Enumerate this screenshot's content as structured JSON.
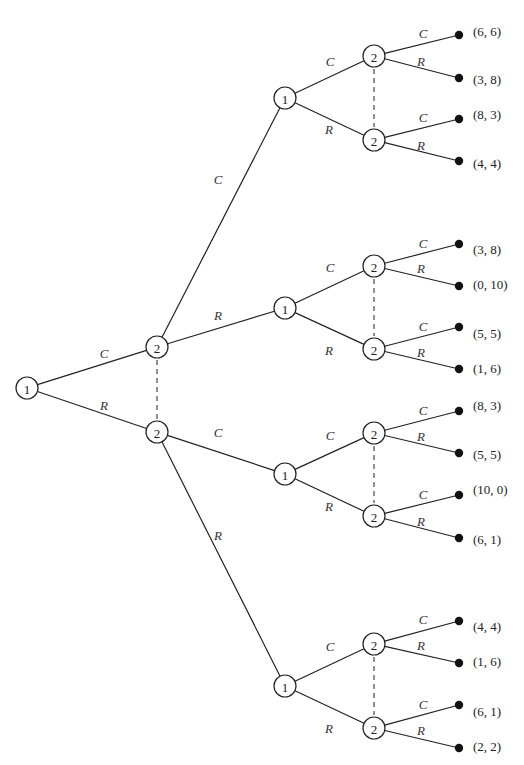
{
  "diagram": {
    "type": "extensive-form game tree",
    "players": [
      "1",
      "2"
    ],
    "actions": [
      "C",
      "R"
    ],
    "root": {
      "id": "n0",
      "player": "1",
      "x": 27,
      "y": 388
    },
    "nodes": [
      {
        "id": "n0",
        "player": "1",
        "x": 27,
        "y": 388
      },
      {
        "id": "a",
        "player": "2",
        "x": 157,
        "y": 347
      },
      {
        "id": "b",
        "player": "2",
        "x": 157,
        "y": 432
      },
      {
        "id": "aC",
        "player": "1",
        "x": 285,
        "y": 98
      },
      {
        "id": "aR",
        "player": "1",
        "x": 285,
        "y": 308
      },
      {
        "id": "bC",
        "player": "1",
        "x": 285,
        "y": 474
      },
      {
        "id": "bR",
        "player": "1",
        "x": 285,
        "y": 686
      },
      {
        "id": "aCC",
        "player": "2",
        "x": 374,
        "y": 56
      },
      {
        "id": "aCR",
        "player": "2",
        "x": 374,
        "y": 140
      },
      {
        "id": "aRC",
        "player": "2",
        "x": 374,
        "y": 266
      },
      {
        "id": "aRR",
        "player": "2",
        "x": 374,
        "y": 349
      },
      {
        "id": "bCC",
        "player": "2",
        "x": 374,
        "y": 433
      },
      {
        "id": "bCR",
        "player": "2",
        "x": 374,
        "y": 516
      },
      {
        "id": "bRC",
        "player": "2",
        "x": 374,
        "y": 644
      },
      {
        "id": "bRR",
        "player": "2",
        "x": 374,
        "y": 728
      }
    ],
    "edges": [
      {
        "from": "n0",
        "to": "a",
        "label": "C",
        "lx": 104,
        "ly": 358
      },
      {
        "from": "n0",
        "to": "b",
        "label": "R",
        "lx": 104,
        "ly": 410
      },
      {
        "from": "a",
        "to": "aC",
        "label": "C",
        "lx": 218,
        "ly": 184
      },
      {
        "from": "a",
        "to": "aR",
        "label": "R",
        "lx": 218,
        "ly": 320
      },
      {
        "from": "b",
        "to": "bC",
        "label": "C",
        "lx": 218,
        "ly": 437
      },
      {
        "from": "b",
        "to": "bR",
        "label": "R",
        "lx": 218,
        "ly": 540
      },
      {
        "from": "aC",
        "to": "aCC",
        "label": "C",
        "lx": 330,
        "ly": 66
      },
      {
        "from": "aC",
        "to": "aCR",
        "label": "R",
        "lx": 329,
        "ly": 134
      },
      {
        "from": "aR",
        "to": "aRC",
        "label": "C",
        "lx": 330,
        "ly": 272
      },
      {
        "from": "aR",
        "to": "aRR",
        "label": "R",
        "lx": 329,
        "ly": 355
      },
      {
        "from": "bC",
        "to": "bCC",
        "label": "C",
        "lx": 330,
        "ly": 440
      },
      {
        "from": "bC",
        "to": "bCR",
        "label": "R",
        "lx": 329,
        "ly": 511
      },
      {
        "from": "bR",
        "to": "bRC",
        "label": "C",
        "lx": 330,
        "ly": 651
      },
      {
        "from": "bR",
        "to": "bRR",
        "label": "R",
        "lx": 329,
        "ly": 733
      }
    ],
    "information_sets": [
      {
        "player": "2",
        "nodes": [
          "a",
          "b"
        ]
      },
      {
        "player": "2",
        "nodes": [
          "aCC",
          "aCR"
        ]
      },
      {
        "player": "2",
        "nodes": [
          "aRC",
          "aRR"
        ]
      },
      {
        "player": "2",
        "nodes": [
          "bCC",
          "bCR"
        ]
      },
      {
        "player": "2",
        "nodes": [
          "bRC",
          "bRR"
        ]
      }
    ],
    "leaves": [
      {
        "from": "aCC",
        "action": "C",
        "payoff": "(6, 6)",
        "x": 459,
        "y": 35,
        "px": 473,
        "py": 31,
        "lx": 423,
        "ly": 38
      },
      {
        "from": "aCC",
        "action": "R",
        "payoff": "(3, 8)",
        "x": 459,
        "y": 78,
        "px": 473,
        "py": 79,
        "lx": 421,
        "ly": 66
      },
      {
        "from": "aCR",
        "action": "C",
        "payoff": "(8, 3)",
        "x": 459,
        "y": 119,
        "px": 473,
        "py": 114,
        "lx": 423,
        "ly": 122
      },
      {
        "from": "aCR",
        "action": "R",
        "payoff": "(4, 4)",
        "x": 459,
        "y": 161,
        "px": 473,
        "py": 163,
        "lx": 421,
        "ly": 150
      },
      {
        "from": "aRC",
        "action": "C",
        "payoff": "(3, 8)",
        "x": 459,
        "y": 244,
        "px": 473,
        "py": 249,
        "lx": 423,
        "ly": 248
      },
      {
        "from": "aRC",
        "action": "R",
        "payoff": "(0, 10)",
        "x": 459,
        "y": 286,
        "px": 473,
        "py": 284,
        "lx": 421,
        "ly": 273
      },
      {
        "from": "aRR",
        "action": "C",
        "payoff": "(5, 5)",
        "x": 459,
        "y": 327,
        "px": 473,
        "py": 333,
        "lx": 423,
        "ly": 331
      },
      {
        "from": "aRR",
        "action": "R",
        "payoff": "(1, 6)",
        "x": 459,
        "y": 369,
        "px": 473,
        "py": 368,
        "lx": 421,
        "ly": 357
      },
      {
        "from": "bCC",
        "action": "C",
        "payoff": "(8, 3)",
        "x": 459,
        "y": 411,
        "px": 473,
        "py": 405,
        "lx": 423,
        "ly": 415
      },
      {
        "from": "bCC",
        "action": "R",
        "payoff": "(5, 5)",
        "x": 459,
        "y": 453,
        "px": 473,
        "py": 454,
        "lx": 421,
        "ly": 441
      },
      {
        "from": "bCR",
        "action": "C",
        "payoff": "(10, 0)",
        "x": 459,
        "y": 495,
        "px": 473,
        "py": 489,
        "lx": 423,
        "ly": 499
      },
      {
        "from": "bCR",
        "action": "R",
        "payoff": "(6, 1)",
        "x": 459,
        "y": 538,
        "px": 473,
        "py": 539,
        "lx": 421,
        "ly": 526
      },
      {
        "from": "bRC",
        "action": "C",
        "payoff": "(4, 4)",
        "x": 459,
        "y": 621,
        "px": 473,
        "py": 626,
        "lx": 423,
        "ly": 624
      },
      {
        "from": "bRC",
        "action": "R",
        "payoff": "(1, 6)",
        "x": 459,
        "y": 663,
        "px": 473,
        "py": 661,
        "lx": 421,
        "ly": 650
      },
      {
        "from": "bRR",
        "action": "C",
        "payoff": "(6, 1)",
        "x": 459,
        "y": 705,
        "px": 473,
        "py": 711,
        "lx": 423,
        "ly": 709
      },
      {
        "from": "bRR",
        "action": "R",
        "payoff": "(2, 2)",
        "x": 459,
        "y": 748,
        "px": 473,
        "py": 746,
        "lx": 421,
        "ly": 735
      }
    ]
  }
}
